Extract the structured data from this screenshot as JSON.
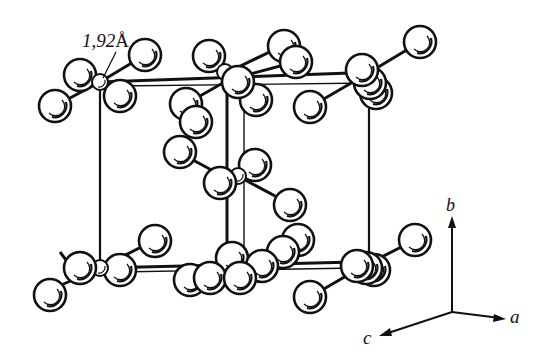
{
  "diagram": {
    "type": "crystal-structure",
    "bond_length_label": "1,92",
    "bond_length_unit": "Å",
    "axes": {
      "a": "a",
      "b": "b",
      "c": "c"
    },
    "colors": {
      "ink": "#111111",
      "atom_fill": "#ffffff",
      "background": "#ffffff"
    }
  }
}
